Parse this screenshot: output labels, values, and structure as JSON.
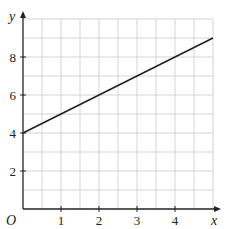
{
  "chart_data": {
    "type": "line",
    "title": "",
    "xlabel": "x",
    "ylabel": "y",
    "origin_label": "O",
    "xlim": [
      0,
      5
    ],
    "ylim": [
      0,
      10
    ],
    "grid": true,
    "x_grid_step": 0.5,
    "y_grid_step": 1,
    "x_ticks": [
      1,
      2,
      3,
      4
    ],
    "x_tick_labels": [
      "1",
      "2",
      "3",
      "4"
    ],
    "y_ticks": [
      2,
      4,
      6,
      8
    ],
    "y_tick_labels": [
      "2",
      "4",
      "6",
      "8"
    ],
    "series": [
      {
        "name": "y = x + 4",
        "x": [
          0,
          5
        ],
        "y": [
          4,
          9
        ]
      }
    ]
  },
  "colors": {
    "grid": "#c8c8c8",
    "axis": "#222222",
    "line": "#222222"
  }
}
